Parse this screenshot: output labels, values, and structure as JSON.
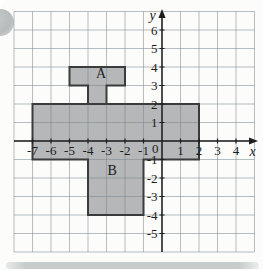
{
  "figure": {
    "colors": {
      "background": "#fcfcfb",
      "grid_line": "rgba(122,136,144,0.55)",
      "region_fill": "#b5b7b8",
      "region_border": "#393b3c",
      "axis": "#1e1e1e",
      "text": "#1c1c1c"
    }
  },
  "chart_data": {
    "type": "coordinate-plane-regions",
    "title": "",
    "grid": {
      "on": true,
      "x_range": [
        -8,
        5
      ],
      "y_range": [
        -6,
        7
      ]
    },
    "x_axis": {
      "label": "x",
      "ticks": [
        {
          "value": -7,
          "label": "-7"
        },
        {
          "value": -6,
          "label": "-6"
        },
        {
          "value": -5,
          "label": "-5"
        },
        {
          "value": -4,
          "label": "-4"
        },
        {
          "value": -3,
          "label": "-3"
        },
        {
          "value": -2,
          "label": "-2"
        },
        {
          "value": -1,
          "label": "-1"
        },
        {
          "value": 1,
          "label": "1"
        },
        {
          "value": 2,
          "label": "2"
        },
        {
          "value": 3,
          "label": "3"
        },
        {
          "value": 4,
          "label": "4"
        }
      ]
    },
    "y_axis": {
      "label": "y",
      "ticks": [
        {
          "value": -5,
          "label": "-5"
        },
        {
          "value": -4,
          "label": "-4"
        },
        {
          "value": -3,
          "label": "-3"
        },
        {
          "value": -2,
          "label": "-2"
        },
        {
          "value": -1,
          "label": "-1"
        },
        {
          "value": 1,
          "label": "1"
        },
        {
          "value": 2,
          "label": "2"
        },
        {
          "value": 3,
          "label": "3"
        },
        {
          "value": 4,
          "label": "4"
        },
        {
          "value": 5,
          "label": "5"
        },
        {
          "value": 6,
          "label": "6"
        }
      ]
    },
    "origin_label": "0",
    "regions": [
      {
        "name": "shape-a",
        "vertices": [
          [
            -5,
            4
          ],
          [
            -2,
            4
          ],
          [
            -2,
            3
          ],
          [
            -3,
            3
          ],
          [
            -3,
            2
          ],
          [
            -4,
            2
          ],
          [
            -4,
            3
          ],
          [
            -5,
            3
          ]
        ]
      },
      {
        "name": "shape-main",
        "vertices": [
          [
            -7,
            2
          ],
          [
            2,
            2
          ],
          [
            2,
            -1
          ],
          [
            -1,
            -1
          ],
          [
            -1,
            -4
          ],
          [
            -4,
            -4
          ],
          [
            -4,
            -1
          ],
          [
            -7,
            -1
          ]
        ]
      }
    ],
    "annotations": [
      {
        "text": "A",
        "x": -3.3,
        "y": 3.7
      },
      {
        "text": "B",
        "x": -2.7,
        "y": -1.55
      }
    ]
  }
}
